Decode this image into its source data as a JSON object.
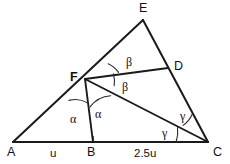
{
  "figure": {
    "type": "geometry-diagram",
    "background_color": "#ffffff",
    "stroke_color": "#1a1a1a"
  },
  "points": {
    "A": {
      "label": "A",
      "x": 13,
      "y": 142,
      "label_x": 7,
      "label_y": 146
    },
    "B": {
      "label": "B",
      "x": 93,
      "y": 142,
      "label_x": 87,
      "label_y": 146
    },
    "C": {
      "label": "C",
      "x": 208,
      "y": 142,
      "label_x": 213,
      "label_y": 146
    },
    "D": {
      "label": "D",
      "x": 168,
      "y": 68,
      "label_x": 174,
      "label_y": 60
    },
    "E": {
      "label": "E",
      "x": 143,
      "y": 20,
      "label_x": 139,
      "label_y": 2
    },
    "F": {
      "label": "F",
      "x": 85,
      "y": 79,
      "label_x": 70,
      "label_y": 71
    }
  },
  "segments": [
    {
      "name": "side-AE",
      "from": "A",
      "to": "E",
      "style": "edge"
    },
    {
      "name": "side-EC",
      "from": "E",
      "to": "C",
      "style": "edge"
    },
    {
      "name": "side-AC",
      "from": "A",
      "to": "C",
      "style": "edge"
    },
    {
      "name": "cevian-FD",
      "from": "F",
      "to": "D",
      "style": "cevian"
    },
    {
      "name": "cevian-FC",
      "from": "F",
      "to": "C",
      "style": "cevian"
    },
    {
      "name": "cevian-FB",
      "from": "F",
      "to": "B",
      "style": "cevian"
    }
  ],
  "angle_labels": [
    {
      "name": "angle-beta-upper",
      "text": "β",
      "x": 126,
      "y": 56,
      "at": "F",
      "between": "FE and FD"
    },
    {
      "name": "angle-beta-lower",
      "text": "β",
      "x": 122,
      "y": 81,
      "at": "F",
      "between": "FD and FC"
    },
    {
      "name": "angle-alpha-left",
      "text": "α",
      "x": 70,
      "y": 113,
      "at": "F",
      "between": "FA and FB"
    },
    {
      "name": "angle-alpha-right",
      "text": "α",
      "x": 95,
      "y": 108,
      "at": "F",
      "between": "FB and FC"
    },
    {
      "name": "angle-gamma-upper",
      "text": "γ",
      "x": 180,
      "y": 110,
      "at": "C",
      "between": "CD and CF"
    },
    {
      "name": "angle-gamma-lower",
      "text": "γ",
      "x": 162,
      "y": 127,
      "at": "C",
      "between": "CF and CA"
    }
  ],
  "side_labels": [
    {
      "name": "side-label-u",
      "text": "u",
      "x": 50,
      "y": 148,
      "segment": "A to B"
    },
    {
      "name": "side-label-2-5u",
      "text": "2.5u",
      "x": 134,
      "y": 148,
      "segment": "B to C"
    }
  ],
  "tick_marks": [
    {
      "name": "tick-at-B",
      "x": 93,
      "y1": 136,
      "y2": 142
    }
  ],
  "angle_arcs": [
    {
      "name": "arc-beta-upper",
      "path": "M 108.2 63.8 A 26 26 0 0 1 118.5 72.4"
    },
    {
      "name": "arc-beta-lower",
      "path": "M 113.5 73.9 A 30 30 0 0 1 114.2 85.6"
    },
    {
      "name": "arc-alpha-left",
      "path": "M 69.0 100.4 A 24 24 0 0 1 87.6 102.9"
    },
    {
      "name": "arc-alpha-right",
      "path": "M 90.0 106.9 A 28 28 0 0 1 110.7 95.7"
    },
    {
      "name": "arc-gamma-upper",
      "path": "M 192.2 114.3 A 26 26 0 0 1 183.1 125.4"
    },
    {
      "name": "arc-gamma-lower",
      "path": "M 177.5 127.6 A 32 32 0 0 1 176.1 142.0"
    }
  ],
  "chart_data": {
    "type": "diagram",
    "title": "",
    "notation": {
      "alpha": "α",
      "beta": "β",
      "gamma": "γ"
    },
    "measured_lengths": {
      "AB": "u",
      "BC": "2.5u"
    },
    "vertex_names": [
      "A",
      "B",
      "C",
      "D",
      "E",
      "F"
    ]
  }
}
